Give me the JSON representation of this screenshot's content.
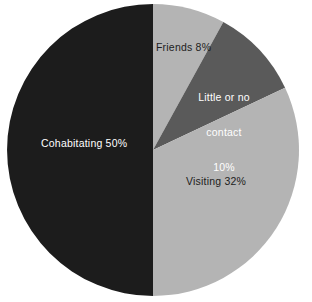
{
  "chart_data": {
    "type": "pie",
    "title": "",
    "subtitle": "",
    "xlabel": "",
    "ylabel": "",
    "legend_position": "none",
    "grid": false,
    "labels_inside": true,
    "start_angle_deg": 0,
    "direction": "clockwise",
    "categories": [
      "Friends",
      "Little or no contact",
      "Visiting",
      "Cohabitating"
    ],
    "values": [
      8,
      10,
      32,
      50
    ],
    "units": "percent",
    "slices": [
      {
        "name": "Friends",
        "value": 8,
        "value_text": "8%",
        "label_text": "Friends 8%",
        "color": "#b4b4b4",
        "text_color": "#1d1d1d",
        "start_deg": 0,
        "end_deg": 28.8
      },
      {
        "name": "Little or no contact",
        "value": 10,
        "value_text": "10%",
        "label_line1": "Little or no",
        "label_line2": "contact",
        "label_line3": "10%",
        "color": "#5a5a5a",
        "text_color": "#ffffff",
        "start_deg": 28.8,
        "end_deg": 64.8
      },
      {
        "name": "Visiting",
        "value": 32,
        "value_text": "32%",
        "label_text": "Visiting 32%",
        "color": "#b4b4b4",
        "text_color": "#1d1d1d",
        "start_deg": 64.8,
        "end_deg": 180
      },
      {
        "name": "Cohabitating",
        "value": 50,
        "value_text": "50%",
        "label_text": "Cohabitating 50%",
        "color": "#1c1c1c",
        "text_color": "#ffffff",
        "start_deg": 180,
        "end_deg": 360
      }
    ],
    "background_color": "#ffffff"
  }
}
